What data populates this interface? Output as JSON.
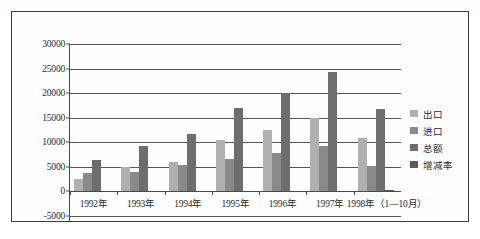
{
  "chart_data": {
    "type": "bar",
    "title": "",
    "xlabel": "",
    "ylabel": "",
    "grid": true,
    "legend_position": "right",
    "ylim": [
      -5000,
      30000
    ],
    "ytick_labels": [
      "30000",
      "25000",
      "20000",
      "15000",
      "10000",
      "5000",
      "0",
      "-5000"
    ],
    "yticks": [
      30000,
      25000,
      20000,
      15000,
      10000,
      5000,
      0,
      -5000
    ],
    "categories": [
      "1992年",
      "1993年",
      "1994年",
      "1995年",
      "1996年",
      "1997年",
      "1998年（1—10月）"
    ],
    "series": [
      {
        "name": "出口",
        "color": "#b0b0b0",
        "values": [
          2500,
          4900,
          6000,
          10400,
          12400,
          15000,
          10900
        ]
      },
      {
        "name": "进口",
        "color": "#8a8a8a",
        "values": [
          3600,
          3900,
          5400,
          6600,
          7700,
          9100,
          5200
        ]
      },
      {
        "name": "总额",
        "color": "#6e6e6e",
        "values": [
          6400,
          9200,
          11700,
          17000,
          20000,
          24300,
          16800
        ]
      },
      {
        "name": "增减率",
        "color": "#5a5a5a",
        "values": [
          0,
          0,
          0,
          0,
          0,
          0,
          300
        ]
      }
    ]
  },
  "legend": {
    "items": [
      {
        "label": "出口"
      },
      {
        "label": "进口"
      },
      {
        "label": "总额"
      },
      {
        "label": "增减率"
      }
    ]
  }
}
